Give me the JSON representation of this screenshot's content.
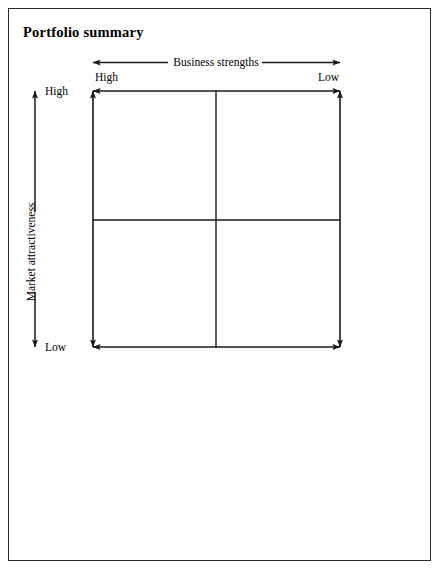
{
  "figure": {
    "title": "Portfolio summary",
    "type": "2x2 portfolio matrix"
  },
  "x_axis": {
    "name": "Business strengths",
    "label": "Business strengths",
    "low_end_label": "Low",
    "high_end_label": "High",
    "high_side": "left",
    "low_side": "right",
    "arrow_style": "double-headed"
  },
  "y_axis": {
    "name": "Market attractiveness",
    "label": "Market attractiveness",
    "high_end_label": "High",
    "low_end_label": "Low",
    "high_side": "top",
    "low_side": "bottom",
    "arrow_style": "double-headed",
    "orientation": "vertical"
  },
  "matrix": {
    "rows": 2,
    "columns": 2,
    "cells": [
      {
        "id": "cell-top-left",
        "label": "",
        "row": "high",
        "column": "high"
      },
      {
        "id": "cell-top-right",
        "label": "",
        "row": "high",
        "column": "low"
      },
      {
        "id": "cell-bottom-left",
        "label": "",
        "row": "low",
        "column": "high"
      },
      {
        "id": "cell-bottom-right",
        "label": "",
        "row": "low",
        "column": "low"
      }
    ]
  },
  "colors": {
    "line": "#1a1a1a",
    "border": "#2b2b2b",
    "background": "#ffffff",
    "text": "#000000"
  }
}
